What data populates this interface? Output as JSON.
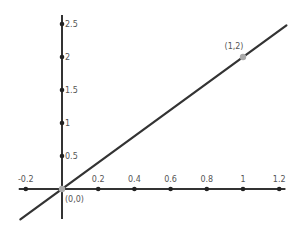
{
  "chart_data": {
    "type": "line",
    "title": "",
    "xlabel": "",
    "ylabel": "",
    "xlim": [
      -0.25,
      1.24
    ],
    "ylim": [
      -0.47,
      2.65
    ],
    "grid": false,
    "legend": null,
    "x_ticks": [
      -0.2,
      0.2,
      0.4,
      0.6,
      0.8,
      1,
      1.2
    ],
    "x_tick_labels": [
      "-0.2",
      "0.2",
      "0.4",
      "0.6",
      "0.8",
      "1",
      "1.2"
    ],
    "y_ticks": [
      0.5,
      1,
      1.5,
      2,
      2.5
    ],
    "y_tick_labels": [
      "0.5",
      "1",
      "1.5",
      "2",
      "2.5"
    ],
    "series": [
      {
        "name": "y = 2x",
        "equation": "y = 2x",
        "x": [
          -0.23,
          1.24
        ],
        "y": [
          -0.46,
          2.48
        ],
        "color": "#333333"
      }
    ],
    "points": [
      {
        "label": "(0,0)",
        "x": 0,
        "y": 0,
        "color": "#aaaaaa"
      },
      {
        "label": "(1,2)",
        "x": 1,
        "y": 2,
        "color": "#aaaaaa"
      }
    ]
  },
  "colors": {
    "axis": "#333333",
    "line": "#333333",
    "tick_dot": "#222222",
    "point": "#aaaaaa",
    "text": "#555555"
  }
}
